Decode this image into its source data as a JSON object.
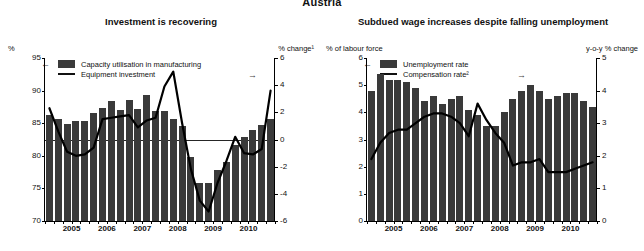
{
  "page": {
    "title": "Austria"
  },
  "charts": [
    {
      "id": "investment",
      "title": "Investment is recovering",
      "left_unit": "%",
      "right_unit": "% change¹",
      "legend": [
        {
          "type": "bar",
          "label": "Capacity utilisation in manufacturing"
        },
        {
          "type": "line",
          "label": "Equipment investment"
        }
      ],
      "arrow_left": "←",
      "arrow_right": "→",
      "chart_data": {
        "type": "bar",
        "title": "Investment is recovering",
        "xlabel": "",
        "ylabel": "%",
        "ylim": [
          70,
          95
        ],
        "yticks": [
          70,
          75,
          80,
          85,
          90,
          95
        ],
        "y2label": "% change",
        "y2lim": [
          -6,
          6
        ],
        "y2ticks": [
          -6,
          -4,
          -2,
          0,
          2,
          4,
          6
        ],
        "grid": false,
        "legend_position": "top-left",
        "categories": [
          "2004Q4",
          "2005Q1",
          "2005Q2",
          "2005Q3",
          "2005Q4",
          "2006Q1",
          "2006Q2",
          "2006Q3",
          "2006Q4",
          "2007Q1",
          "2007Q2",
          "2007Q3",
          "2007Q4",
          "2008Q1",
          "2008Q2",
          "2008Q3",
          "2008Q4",
          "2009Q1",
          "2009Q2",
          "2009Q3",
          "2009Q4",
          "2010Q1",
          "2010Q2",
          "2010Q3",
          "2010Q4",
          "2011Q1"
        ],
        "xtick_labels": [
          "2005",
          "2006",
          "2007",
          "2008",
          "2009",
          "2010"
        ],
        "series": [
          {
            "name": "Capacity utilisation in manufacturing",
            "axis": "left",
            "type": "bar",
            "values": [
              86.3,
              85.6,
              84.9,
              85.3,
              85.3,
              86.6,
              87.3,
              88.4,
              87.1,
              88.6,
              87.2,
              89.3,
              86.8,
              86.8,
              85.6,
              84.5,
              79.8,
              75.8,
              75.8,
              77.9,
              79.1,
              81.6,
              82.9,
              83.9,
              84.8,
              85.7
            ]
          },
          {
            "name": "Equipment investment",
            "axis": "right",
            "type": "line",
            "values": [
              2.3,
              0.6,
              -0.9,
              -1.2,
              -1.1,
              -0.6,
              1.5,
              1.6,
              1.7,
              1.8,
              0.9,
              1.4,
              1.6,
              3.9,
              5.0,
              1.2,
              -2.2,
              -4.5,
              -5.3,
              -3.2,
              -1.6,
              0.2,
              -1.0,
              -1.1,
              -0.7,
              3.6
            ]
          }
        ]
      }
    },
    {
      "id": "unemployment",
      "title": "Subdued wage increases despite falling unemployment",
      "left_unit": "% of labour force",
      "right_unit": "y-o-y % change",
      "legend": [
        {
          "type": "bar",
          "label": "Unemployment rate"
        },
        {
          "type": "line",
          "label": "Compensation rate²"
        }
      ],
      "arrow_left": "←",
      "arrow_right": "→",
      "chart_data": {
        "type": "bar",
        "title": "Subdued wage increases despite falling unemployment",
        "xlabel": "",
        "ylabel": "% of labour force",
        "ylim": [
          0,
          6
        ],
        "yticks": [
          0,
          1,
          2,
          3,
          4,
          5,
          6
        ],
        "y2label": "y-o-y % change",
        "y2lim": [
          0,
          5
        ],
        "y2ticks": [
          0,
          1,
          2,
          3,
          4,
          5
        ],
        "grid": false,
        "legend_position": "top-left",
        "categories": [
          "2004Q4",
          "2005Q1",
          "2005Q2",
          "2005Q3",
          "2005Q4",
          "2006Q1",
          "2006Q2",
          "2006Q3",
          "2006Q4",
          "2007Q1",
          "2007Q2",
          "2007Q3",
          "2007Q4",
          "2008Q1",
          "2008Q2",
          "2008Q3",
          "2008Q4",
          "2009Q1",
          "2009Q2",
          "2009Q3",
          "2009Q4",
          "2010Q1",
          "2010Q2",
          "2010Q3",
          "2010Q4",
          "2011Q1"
        ],
        "xtick_labels": [
          "2005",
          "2006",
          "2007",
          "2008",
          "2009",
          "2010"
        ],
        "series": [
          {
            "name": "Unemployment rate",
            "axis": "left",
            "type": "bar",
            "values": [
              4.8,
              5.4,
              5.2,
              5.2,
              5.1,
              4.9,
              4.4,
              4.6,
              4.3,
              4.5,
              4.6,
              4.1,
              3.9,
              3.5,
              3.5,
              4.0,
              4.5,
              4.8,
              5.0,
              4.8,
              4.5,
              4.6,
              4.7,
              4.7,
              4.4,
              4.2
            ]
          },
          {
            "name": "Compensation rate",
            "axis": "right",
            "type": "line",
            "values": [
              1.9,
              2.4,
              2.7,
              2.8,
              2.8,
              3.0,
              3.2,
              3.3,
              3.3,
              3.2,
              3.0,
              2.6,
              3.6,
              3.1,
              2.7,
              2.4,
              1.7,
              1.8,
              1.8,
              1.9,
              1.5,
              1.5,
              1.5,
              1.6,
              1.7,
              1.8
            ]
          }
        ]
      }
    }
  ]
}
